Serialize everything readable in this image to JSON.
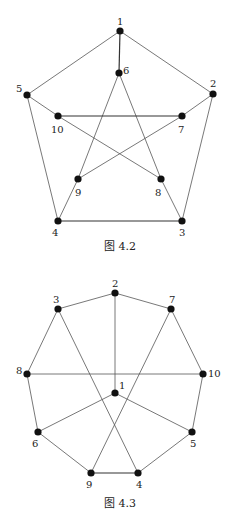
{
  "figures": [
    {
      "caption": "图 4.2",
      "caption_pos": [
        120,
        250
      ],
      "nodes": [
        {
          "id": "1",
          "x": 120,
          "y": 31,
          "lx": 117,
          "ly": 25
        },
        {
          "id": "2",
          "x": 213,
          "y": 94,
          "lx": 210,
          "ly": 87
        },
        {
          "id": "3",
          "x": 182,
          "y": 221,
          "lx": 179,
          "ly": 236
        },
        {
          "id": "4",
          "x": 58,
          "y": 221,
          "lx": 52,
          "ly": 236
        },
        {
          "id": "5",
          "x": 27,
          "y": 95,
          "lx": 16,
          "ly": 92
        },
        {
          "id": "6",
          "x": 119,
          "y": 73,
          "lx": 123,
          "ly": 74
        },
        {
          "id": "7",
          "x": 182,
          "y": 116,
          "lx": 178,
          "ly": 133
        },
        {
          "id": "8",
          "x": 161,
          "y": 179,
          "lx": 155,
          "ly": 196
        },
        {
          "id": "9",
          "x": 78,
          "y": 179,
          "lx": 75,
          "ly": 196
        },
        {
          "id": "10",
          "x": 58,
          "y": 116,
          "lx": 51,
          "ly": 133
        }
      ],
      "edges": [
        [
          "1",
          "2",
          0
        ],
        [
          "1",
          "5",
          0
        ],
        [
          "1",
          "6",
          1
        ],
        [
          "2",
          "3",
          0
        ],
        [
          "2",
          "7",
          0
        ],
        [
          "3",
          "4",
          1
        ],
        [
          "3",
          "8",
          0
        ],
        [
          "4",
          "5",
          0
        ],
        [
          "4",
          "9",
          0
        ],
        [
          "5",
          "10",
          0
        ],
        [
          "6",
          "9",
          0
        ],
        [
          "6",
          "8",
          0
        ],
        [
          "7",
          "10",
          1
        ],
        [
          "7",
          "9",
          0
        ],
        [
          "10",
          "8",
          0
        ]
      ]
    },
    {
      "caption": "图 4.3",
      "caption_pos": [
        120,
        507
      ],
      "nodes": [
        {
          "id": "1",
          "x": 115,
          "y": 393,
          "lx": 119,
          "ly": 389
        },
        {
          "id": "2",
          "x": 115,
          "y": 293,
          "lx": 112,
          "ly": 287
        },
        {
          "id": "3",
          "x": 58,
          "y": 309,
          "lx": 53,
          "ly": 303
        },
        {
          "id": "4",
          "x": 138,
          "y": 473,
          "lx": 136,
          "ly": 488
        },
        {
          "id": "5",
          "x": 192,
          "y": 432,
          "lx": 190,
          "ly": 447
        },
        {
          "id": "6",
          "x": 38,
          "y": 432,
          "lx": 32,
          "ly": 447
        },
        {
          "id": "7",
          "x": 171,
          "y": 309,
          "lx": 169,
          "ly": 303
        },
        {
          "id": "8",
          "x": 27,
          "y": 374,
          "lx": 16,
          "ly": 374
        },
        {
          "id": "9",
          "x": 91,
          "y": 473,
          "lx": 86,
          "ly": 488
        },
        {
          "id": "10",
          "x": 203,
          "y": 374,
          "lx": 208,
          "ly": 377
        }
      ],
      "edges": [
        [
          "2",
          "3",
          0
        ],
        [
          "2",
          "7",
          0
        ],
        [
          "2",
          "1",
          0
        ],
        [
          "3",
          "8",
          0
        ],
        [
          "3",
          "4",
          0
        ],
        [
          "7",
          "10",
          0
        ],
        [
          "7",
          "9",
          0
        ],
        [
          "8",
          "10",
          0
        ],
        [
          "8",
          "6",
          0
        ],
        [
          "10",
          "5",
          0
        ],
        [
          "1",
          "6",
          0
        ],
        [
          "1",
          "5",
          0
        ],
        [
          "6",
          "9",
          0
        ],
        [
          "5",
          "4",
          0
        ],
        [
          "9",
          "4",
          1
        ]
      ]
    }
  ]
}
